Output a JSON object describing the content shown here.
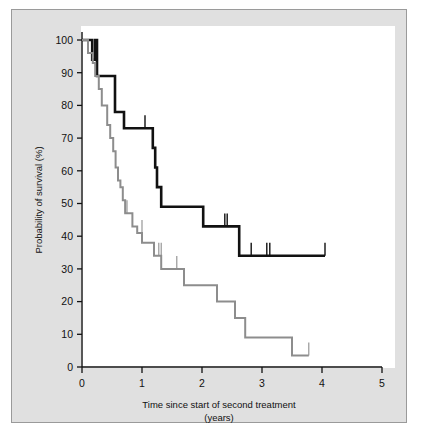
{
  "figure": {
    "panel_background": "#e0e0e0",
    "plot_background": "#ffffff",
    "border_color": "#9a9a9a"
  },
  "chart_data": {
    "type": "line",
    "title": "",
    "subtitle": "",
    "xlabel": "Time since start of second treatment",
    "xlabel_units": "(years)",
    "ylabel": "Probability of survival (%)",
    "xlim": [
      0,
      5
    ],
    "ylim": [
      0,
      100
    ],
    "xticks": [
      0,
      1,
      2,
      3,
      4,
      5
    ],
    "xtick_labels": [
      "0",
      "1",
      "2",
      "3",
      "4",
      "5"
    ],
    "yticks": [
      0,
      10,
      20,
      30,
      40,
      50,
      60,
      70,
      80,
      90,
      100
    ],
    "ytick_labels": [
      "0",
      "10",
      "20",
      "30",
      "40",
      "50",
      "60",
      "70",
      "80",
      "90",
      "100"
    ],
    "grid": false,
    "legend": "none",
    "legend_position": "none",
    "series": [
      {
        "name": "Black curve",
        "color": "#111111",
        "line_width": 2.6,
        "style": "step-post",
        "points": [
          [
            0.0,
            100
          ],
          [
            0.17,
            100
          ],
          [
            0.17,
            94
          ],
          [
            0.22,
            94
          ],
          [
            0.22,
            100
          ],
          [
            0.25,
            100
          ],
          [
            0.25,
            89
          ],
          [
            0.55,
            89
          ],
          [
            0.55,
            78
          ],
          [
            0.7,
            78
          ],
          [
            0.7,
            73
          ],
          [
            1.05,
            73
          ],
          [
            1.05,
            73
          ],
          [
            1.18,
            73
          ],
          [
            1.18,
            67
          ],
          [
            1.22,
            67
          ],
          [
            1.22,
            61
          ],
          [
            1.25,
            61
          ],
          [
            1.25,
            55
          ],
          [
            1.32,
            55
          ],
          [
            1.32,
            49
          ],
          [
            2.02,
            49
          ],
          [
            2.02,
            43
          ],
          [
            2.62,
            43
          ],
          [
            2.62,
            34
          ],
          [
            4.05,
            34
          ]
        ],
        "censor_marks": [
          [
            1.05,
            73
          ],
          [
            2.38,
            43
          ],
          [
            2.42,
            43
          ],
          [
            2.82,
            34
          ],
          [
            3.08,
            34
          ],
          [
            3.13,
            34
          ],
          [
            4.05,
            34
          ]
        ]
      },
      {
        "name": "Grey curve",
        "color": "#8d8d8d",
        "line_width": 2.0,
        "style": "step-post",
        "points": [
          [
            0.0,
            100
          ],
          [
            0.1,
            100
          ],
          [
            0.1,
            96
          ],
          [
            0.18,
            96
          ],
          [
            0.18,
            93
          ],
          [
            0.22,
            93
          ],
          [
            0.22,
            89
          ],
          [
            0.28,
            89
          ],
          [
            0.28,
            85
          ],
          [
            0.33,
            85
          ],
          [
            0.33,
            80
          ],
          [
            0.42,
            80
          ],
          [
            0.42,
            74
          ],
          [
            0.47,
            74
          ],
          [
            0.47,
            70
          ],
          [
            0.52,
            70
          ],
          [
            0.52,
            66
          ],
          [
            0.56,
            66
          ],
          [
            0.56,
            61
          ],
          [
            0.6,
            61
          ],
          [
            0.6,
            57
          ],
          [
            0.64,
            57
          ],
          [
            0.64,
            55
          ],
          [
            0.68,
            55
          ],
          [
            0.68,
            51
          ],
          [
            0.72,
            51
          ],
          [
            0.72,
            47
          ],
          [
            0.84,
            47
          ],
          [
            0.84,
            43
          ],
          [
            0.92,
            43
          ],
          [
            0.92,
            41
          ],
          [
            1.0,
            41
          ],
          [
            1.0,
            38
          ],
          [
            1.2,
            38
          ],
          [
            1.2,
            34
          ],
          [
            1.32,
            34
          ],
          [
            1.32,
            30
          ],
          [
            1.7,
            30
          ],
          [
            1.7,
            25
          ],
          [
            2.25,
            25
          ],
          [
            2.25,
            20
          ],
          [
            2.55,
            20
          ],
          [
            2.55,
            15
          ],
          [
            2.72,
            15
          ],
          [
            2.72,
            9
          ],
          [
            3.5,
            9
          ],
          [
            3.5,
            3.5
          ],
          [
            3.78,
            3.5
          ]
        ],
        "censor_marks": [
          [
            0.72,
            47
          ],
          [
            0.75,
            47
          ],
          [
            1.0,
            41
          ],
          [
            1.28,
            34
          ],
          [
            1.32,
            34
          ],
          [
            1.58,
            30
          ],
          [
            3.78,
            3.5
          ]
        ]
      }
    ]
  }
}
